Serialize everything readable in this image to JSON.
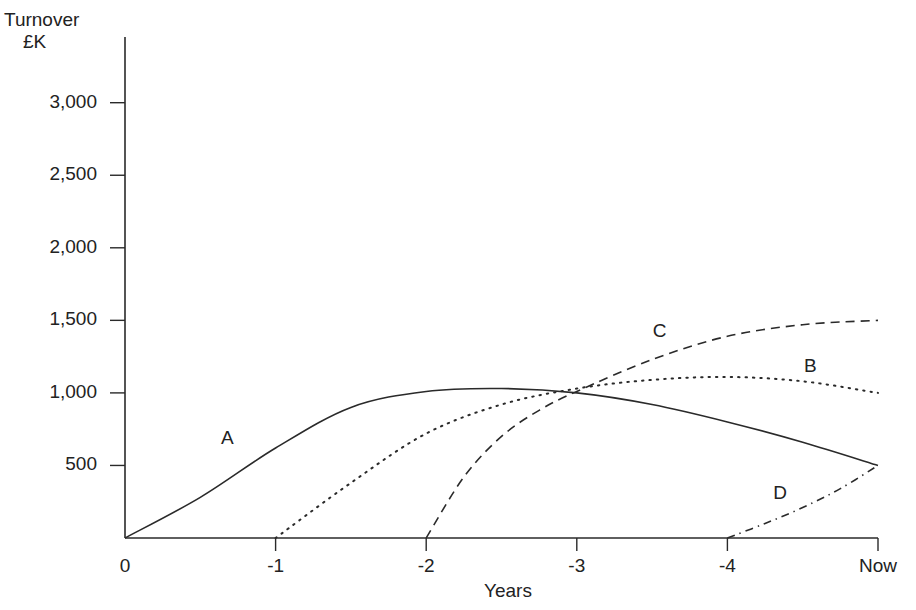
{
  "chart_data": {
    "type": "line",
    "title": "",
    "ylabel": "Turnover £K",
    "ylabel_lines": [
      "Turnover",
      "£K"
    ],
    "xlabel": "Years",
    "x_tick_labels": [
      "0",
      "-1",
      "-2",
      "-3",
      "-4",
      "Now"
    ],
    "y_tick_labels": [
      "500",
      "1,000",
      "1,500",
      "2,000",
      "2,500",
      "3,000"
    ],
    "y_ticks": [
      500,
      1000,
      1500,
      2000,
      2500,
      3000
    ],
    "ylim": [
      0,
      3000
    ],
    "xlim": [
      0,
      5
    ],
    "grid": false,
    "legend": "inline labels",
    "series": [
      {
        "name": "A",
        "style": "solid",
        "label_pos": [
          0.68,
          680
        ],
        "points": [
          [
            0,
            0
          ],
          [
            0.5,
            280
          ],
          [
            1,
            620
          ],
          [
            1.5,
            900
          ],
          [
            2,
            1010
          ],
          [
            2.5,
            1030
          ],
          [
            3,
            1000
          ],
          [
            3.5,
            920
          ],
          [
            4,
            800
          ],
          [
            4.5,
            660
          ],
          [
            5,
            500
          ]
        ]
      },
      {
        "name": "B",
        "style": "dotted",
        "label_pos": [
          4.55,
          1180
        ],
        "points": [
          [
            1,
            0
          ],
          [
            1.5,
            380
          ],
          [
            2,
            720
          ],
          [
            2.5,
            920
          ],
          [
            3,
            1030
          ],
          [
            3.5,
            1090
          ],
          [
            4,
            1110
          ],
          [
            4.5,
            1080
          ],
          [
            5,
            1000
          ]
        ]
      },
      {
        "name": "C",
        "style": "dashed",
        "label_pos": [
          3.55,
          1420
        ],
        "points": [
          [
            2,
            0
          ],
          [
            2.25,
            420
          ],
          [
            2.5,
            700
          ],
          [
            2.75,
            880
          ],
          [
            3,
            1010
          ],
          [
            3.5,
            1230
          ],
          [
            4,
            1390
          ],
          [
            4.5,
            1470
          ],
          [
            5,
            1500
          ]
        ]
      },
      {
        "name": "D",
        "style": "dashdot",
        "label_pos": [
          4.35,
          300
        ],
        "points": [
          [
            4,
            0
          ],
          [
            4.25,
            100
          ],
          [
            4.5,
            210
          ],
          [
            4.75,
            340
          ],
          [
            5,
            500
          ]
        ]
      }
    ]
  }
}
